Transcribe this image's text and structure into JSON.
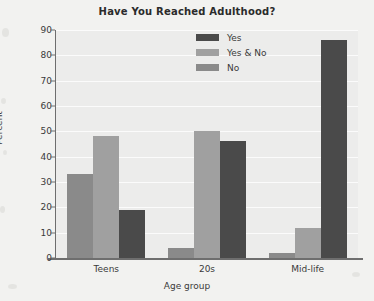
{
  "chart_data": {
    "type": "bar",
    "title": "Have You Reached Adulthood?",
    "xlabel": "Age group",
    "ylabel": "Percent",
    "categories": [
      "Teens",
      "20s",
      "Mid-life"
    ],
    "series": [
      {
        "name": "Yes",
        "color": "#4a4a4a",
        "values": [
          0,
          4,
          2
        ]
      },
      {
        "name": "Yes & No",
        "color": "#a8a8a8",
        "values": [
          33,
          50,
          12
        ]
      },
      {
        "name": "No",
        "color": "#7d7d7d",
        "values": [
          48,
          46,
          86
        ]
      }
    ],
    "ylim": [
      0,
      90
    ],
    "yticks": [
      0,
      10,
      20,
      30,
      40,
      50,
      60,
      70,
      80,
      90
    ],
    "ytick_labels": [
      "0",
      "10",
      "20",
      "30",
      "40",
      "50",
      "60",
      "70",
      "80",
      "90"
    ],
    "grid": true,
    "legend_position": "top-center",
    "plot_background": "#ececeb",
    "figure_background": "#f2f2f0",
    "bars": [
      {
        "category": "Teens",
        "series": "Yes",
        "value": 0,
        "color": "#4a4a4a"
      },
      {
        "category": "Teens",
        "series": "Yes & No",
        "value": 33,
        "color": "#8a8a8a"
      },
      {
        "category": "Teens",
        "series": "No",
        "value": 48,
        "color": "#a0a0a0"
      },
      {
        "category": "Teens",
        "series": "extra",
        "value": 19,
        "color": "#4a4a4a"
      },
      {
        "category": "20s",
        "series": "Yes",
        "value": 4,
        "color": "#8a8a8a"
      },
      {
        "category": "20s",
        "series": "Yes & No",
        "value": 50,
        "color": "#a0a0a0"
      },
      {
        "category": "20s",
        "series": "No",
        "value": 46,
        "color": "#4a4a4a"
      },
      {
        "category": "Mid-life",
        "series": "Yes",
        "value": 2,
        "color": "#8a8a8a"
      },
      {
        "category": "Mid-life",
        "series": "Yes & No",
        "value": 12,
        "color": "#a0a0a0"
      },
      {
        "category": "Mid-life",
        "series": "No",
        "value": 86,
        "color": "#4a4a4a"
      }
    ],
    "legend": [
      {
        "label": "Yes",
        "color": "#4a4a4a"
      },
      {
        "label": "Yes & No",
        "color": "#a0a0a0"
      },
      {
        "label": "No",
        "color": "#8a8a8a"
      }
    ]
  }
}
